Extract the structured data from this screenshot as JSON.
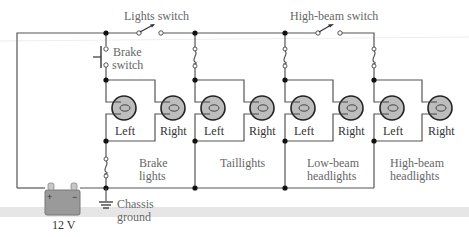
{
  "diagram": {
    "type": "circuit-schematic",
    "colors": {
      "wire": "#555555",
      "bulb_fill": "#bdbdbd",
      "bulb_outline": "#222222",
      "battery_fill": "#999999",
      "label_text": "#666666",
      "band": "#e2e2e2"
    },
    "switches": {
      "lights": "Lights switch",
      "high_beam": "High-beam switch",
      "brake_line1": "Brake",
      "brake_line2": "switch"
    },
    "battery": {
      "label": "12 V",
      "plus": "+",
      "minus": "−"
    },
    "ground": {
      "line1": "Chassis",
      "line2": "ground"
    },
    "groups": [
      {
        "name_line1": "Brake",
        "name_line2": "lights",
        "left": "Left",
        "right": "Right"
      },
      {
        "name_line1": "Taillights",
        "name_line2": "",
        "left": "Left",
        "right": "Right"
      },
      {
        "name_line1": "Low-beam",
        "name_line2": "headlights",
        "left": "Left",
        "right": "Right"
      },
      {
        "name_line1": "High-beam",
        "name_line2": "headlights",
        "left": "Left",
        "right": "Right"
      }
    ]
  }
}
